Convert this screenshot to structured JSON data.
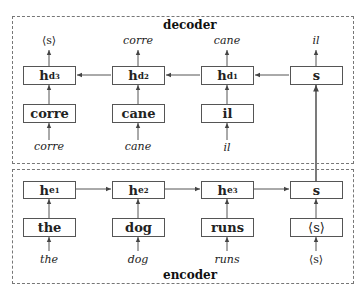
{
  "decoder": {
    "title": "decoder",
    "outputs": [
      "⟨s⟩",
      "corre",
      "cane",
      "il"
    ],
    "hidden": [
      {
        "base": "h",
        "sub": "d",
        "subsub": "3"
      },
      {
        "base": "h",
        "sub": "d",
        "subsub": "2"
      },
      {
        "base": "h",
        "sub": "d",
        "subsub": "1"
      },
      {
        "base": "s",
        "sub": "",
        "subsub": ""
      }
    ],
    "embeddings": [
      "corre",
      "cane",
      "il"
    ],
    "inputs": [
      "corre",
      "cane",
      "il"
    ]
  },
  "encoder": {
    "title": "encoder",
    "hidden": [
      {
        "base": "h",
        "sub": "e",
        "subsub": "1"
      },
      {
        "base": "h",
        "sub": "e",
        "subsub": "2"
      },
      {
        "base": "h",
        "sub": "e",
        "subsub": "3"
      },
      {
        "base": "s",
        "sub": "",
        "subsub": ""
      }
    ],
    "embeddings": [
      "the",
      "dog",
      "runs",
      "⟨s⟩"
    ],
    "inputs": [
      "the",
      "dog",
      "runs",
      "⟨s⟩"
    ]
  },
  "colors": {
    "line": "#555555",
    "border": "#777777",
    "text": "#222222"
  }
}
